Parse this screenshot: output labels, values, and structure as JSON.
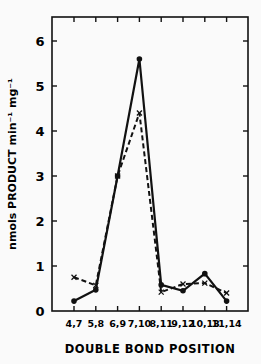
{
  "chart_data": {
    "type": "line",
    "title": "",
    "xlabel": "DOUBLE BOND POSITION",
    "ylabel": "nmols PRODUCT min⁻¹ mg⁻¹",
    "categories": [
      "4,7",
      "5,8",
      "6,9",
      "7,10",
      "8,11",
      "9,12",
      "10,13",
      "11,14"
    ],
    "series": [
      {
        "name": "solid (●)",
        "style": "solid",
        "marker": "dot",
        "values": [
          0.22,
          0.47,
          3.0,
          5.6,
          0.58,
          0.45,
          0.83,
          0.22
        ]
      },
      {
        "name": "dashed (x)",
        "style": "dashed",
        "marker": "x",
        "values": [
          0.75,
          0.57,
          3.0,
          4.4,
          0.42,
          0.6,
          0.62,
          0.4
        ]
      }
    ],
    "ylim": [
      0,
      6.5
    ],
    "yticks": [
      "0",
      "1",
      "2",
      "3",
      "4",
      "5",
      "6"
    ],
    "grid": false,
    "legend": "none"
  }
}
